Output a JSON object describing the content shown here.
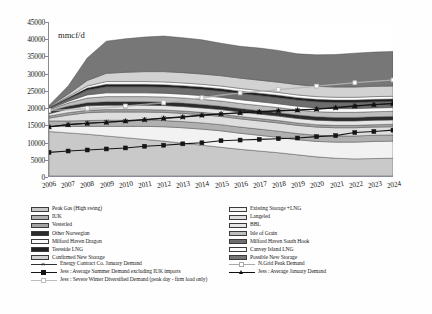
{
  "chart_data": {
    "type": "area",
    "title": "",
    "xlabel": "",
    "ylabel": "mmcf/d",
    "unit_label": "mmcf/d",
    "ylim": [
      0,
      45000
    ],
    "ytick_step": 5000,
    "yticks": [
      "45000",
      "40000",
      "35000",
      "30000",
      "25000",
      "20000",
      "15000",
      "10000",
      "5000",
      "0"
    ],
    "categories": [
      "2006",
      "2007",
      "2008",
      "2009",
      "2010",
      "2011",
      "2012",
      "2013",
      "2014",
      "2015",
      "2016",
      "2017",
      "2018",
      "2019",
      "2020",
      "2021",
      "2022",
      "2023",
      "2024"
    ],
    "grid": false,
    "legend_position": "bottom",
    "stacked_series": [
      {
        "name": "UKCS (Peak Gas High swing base)",
        "legend": "Peak Gas (High swing)",
        "fill": "#c9c9c9",
        "values": [
          13000,
          12600,
          12200,
          11700,
          11200,
          10700,
          10200,
          9600,
          9000,
          8400,
          7800,
          7300,
          6800,
          6200,
          5600,
          5200,
          5000,
          5100,
          5200
        ]
      },
      {
        "name": "Existing Storage + LNG",
        "legend": "Existing Storage +LNG",
        "fill": "#f2f2f2",
        "values": [
          1600,
          1900,
          2300,
          2800,
          3300,
          3800,
          4200,
          4500,
          4700,
          4800,
          4700,
          4600,
          4500,
          4400,
          4500,
          4700,
          4900,
          5000,
          5000
        ]
      },
      {
        "name": "IUK",
        "legend": "IUK",
        "fill": "#b0b0b0",
        "values": [
          1500,
          1600,
          1700,
          1800,
          1800,
          1800,
          1800,
          1800,
          1800,
          1800,
          1800,
          1800,
          1800,
          1800,
          1800,
          1800,
          1800,
          1800,
          1800
        ]
      },
      {
        "name": "Langeled",
        "legend": "Langeled",
        "fill": "#dedede",
        "values": [
          800,
          1700,
          2300,
          2400,
          2400,
          2400,
          2400,
          2400,
          2400,
          2400,
          2400,
          2400,
          2400,
          2400,
          2400,
          2400,
          2400,
          2400,
          2400
        ]
      },
      {
        "name": "Vesterled",
        "legend": "Vesterled",
        "fill": "#a2a2a2",
        "values": [
          600,
          700,
          700,
          700,
          700,
          700,
          700,
          700,
          700,
          700,
          700,
          700,
          700,
          700,
          700,
          700,
          700,
          700,
          700
        ]
      },
      {
        "name": "BBL",
        "legend": "BBL",
        "fill": "#e6e6e6",
        "values": [
          700,
          1100,
          1300,
          1300,
          1300,
          1300,
          1300,
          1300,
          1300,
          1300,
          1300,
          1300,
          1300,
          1300,
          1300,
          1300,
          1300,
          1300,
          1300
        ]
      },
      {
        "name": "Other Norwegian",
        "legend": "Other Norwegian",
        "fill": "#2b2b2b",
        "values": [
          700,
          800,
          900,
          1000,
          1000,
          1000,
          1000,
          1000,
          1000,
          1000,
          1000,
          1000,
          1000,
          1000,
          1000,
          1000,
          1000,
          1000,
          1000
        ]
      },
      {
        "name": "Isle of Grain",
        "legend": "Isle of Grain",
        "fill": "#bdbdbd",
        "values": [
          500,
          900,
          1400,
          1500,
          1500,
          1500,
          1500,
          1500,
          1500,
          1500,
          1500,
          1500,
          1500,
          1500,
          1500,
          1500,
          1500,
          1500,
          1500
        ]
      },
      {
        "name": "Milford Haven Dragon",
        "legend": "Milford Haven Dragon",
        "fill": "#fbfbfb",
        "values": [
          200,
          500,
          900,
          1100,
          1100,
          1100,
          1100,
          1100,
          1100,
          1100,
          1100,
          1100,
          1100,
          1100,
          1100,
          1100,
          1100,
          1100,
          1100
        ]
      },
      {
        "name": "Milford Haven South Hook",
        "legend": "Milford Haven South Hook",
        "fill": "#6e6e6e",
        "values": [
          200,
          700,
          1400,
          1800,
          1800,
          1800,
          1800,
          1800,
          1800,
          1800,
          1800,
          1800,
          1800,
          1800,
          1800,
          1800,
          1800,
          1800,
          1800
        ]
      },
      {
        "name": "Teesside LNG",
        "legend": "Teesside LNG",
        "fill": "#1f1f1f",
        "values": [
          200,
          400,
          600,
          700,
          700,
          700,
          700,
          700,
          700,
          700,
          700,
          700,
          700,
          700,
          700,
          700,
          700,
          700,
          700
        ]
      },
      {
        "name": "Canvey Island LNG",
        "legend": "Canvey Island LNG",
        "fill": "#fdfdfd",
        "values": [
          100,
          300,
          600,
          800,
          800,
          800,
          800,
          800,
          800,
          800,
          800,
          800,
          800,
          800,
          800,
          800,
          800,
          800,
          800
        ]
      },
      {
        "name": "Confirmed New Storage",
        "legend": "Confirmed New Storage",
        "fill": "#d2d2d2",
        "values": [
          200,
          700,
          1600,
          2400,
          2700,
          2900,
          3000,
          3000,
          3000,
          3000,
          3000,
          3000,
          3000,
          3000,
          3000,
          3000,
          3000,
          3000,
          3000
        ]
      },
      {
        "name": "Possible New Storage",
        "legend": "Possible New Storage",
        "fill": "#777777",
        "values": [
          300,
          2400,
          6600,
          9400,
          9800,
          10100,
          10400,
          10200,
          10000,
          9500,
          9300,
          9400,
          9300,
          9000,
          9200,
          9500,
          9900,
          10000,
          10100
        ]
      }
    ],
    "line_series": [
      {
        "name": "Energy Contract Co. January Demand",
        "legend": "Energy Contract Co. January Demand",
        "color": "#303030",
        "marker": "x",
        "values": [
          14300,
          15000,
          15400,
          15700,
          16000,
          16400,
          16800,
          17200,
          17700,
          18100,
          18400,
          18700,
          19000,
          19200,
          19500,
          19900,
          20400,
          20800,
          21100
        ]
      },
      {
        "name": "N.Grid Peak Demand",
        "legend": "N.Grid Peak Demand",
        "color": "#a9a9a9",
        "marker": "square-open",
        "values": [
          19000,
          19300,
          19600,
          19900,
          20300,
          20800,
          21300,
          22000,
          22700,
          23500,
          24200,
          24700,
          25200,
          25700,
          26200,
          26700,
          27200,
          27600,
          28000
        ]
      },
      {
        "name": "Jess : Average Summer Demand excluding IUK imports",
        "legend": "Jess : Average Summer Demand excluding IUK imports",
        "color": "#151515",
        "marker": "square-filled",
        "values": [
          6900,
          7300,
          7600,
          7900,
          8200,
          8700,
          9000,
          9400,
          9700,
          10300,
          10500,
          10700,
          10900,
          11100,
          11500,
          11800,
          12700,
          13000,
          13400
        ]
      },
      {
        "name": "Jess : Average January Demand",
        "legend": "Jess : Average January Demand",
        "color": "#111111",
        "marker": "triangle",
        "values": [
          14400,
          15000,
          15400,
          15700,
          16100,
          16500,
          16900,
          17300,
          17800,
          18200,
          18500,
          18800,
          19100,
          19300,
          19600,
          20000,
          20500,
          20900,
          21200
        ]
      },
      {
        "name": "Jess : Severe Winter Diversified Demand (peak day - firm load only)",
        "legend": "Jess : Severe Winter Diversified Demand (peak day - firm load only)",
        "color": "#bbbbbb",
        "marker": "square-open",
        "values": [
          19200,
          19500,
          19800,
          20100,
          20500,
          21000,
          21500,
          22200,
          22900,
          23700,
          24300,
          24800,
          25300,
          25800,
          26300,
          26800,
          27300,
          27700,
          28100
        ]
      }
    ]
  },
  "legend": {
    "left_column": [
      {
        "label": "Peak Gas (High swing)",
        "swatch": "#c9c9c9",
        "kind": "area"
      },
      {
        "label": "IUK",
        "swatch": "#b0b0b0",
        "kind": "area"
      },
      {
        "label": "Vesterled",
        "swatch": "#a2a2a2",
        "kind": "area"
      },
      {
        "label": "Other Norwegian",
        "swatch": "#2b2b2b",
        "kind": "area"
      },
      {
        "label": "Milford Haven Dragon",
        "swatch": "#fbfbfb",
        "kind": "area"
      },
      {
        "label": "Teesside LNG",
        "swatch": "#1f1f1f",
        "kind": "area"
      },
      {
        "label": "Confirmed New Storage",
        "swatch": "#d2d2d2",
        "kind": "area"
      }
    ],
    "right_column": [
      {
        "label": "Existing Storage +LNG",
        "swatch": "#f2f2f2",
        "kind": "area"
      },
      {
        "label": "Langeled",
        "swatch": "#dedede",
        "kind": "area"
      },
      {
        "label": "BBL",
        "swatch": "#e6e6e6",
        "kind": "area"
      },
      {
        "label": "Isle of Grain",
        "swatch": "#bdbdbd",
        "kind": "area"
      },
      {
        "label": "Milford Haven South Hook",
        "swatch": "#6e6e6e",
        "kind": "area"
      },
      {
        "label": "Canvey Island LNG",
        "swatch": "#fdfdfd",
        "kind": "area"
      },
      {
        "label": "Possible New Storage",
        "swatch": "#777777",
        "kind": "area"
      }
    ],
    "line_entries_left": [
      {
        "label": "Energy Contract Co. January Demand",
        "color": "#303030",
        "marker": "x"
      },
      {
        "label": "Jess : Average Summer Demand excluding IUK imports",
        "color": "#151515",
        "marker": "square-filled"
      },
      {
        "label": "Jess : Severe Winter Diversified Demand (peak day - firm load only)",
        "color": "#bbbbbb",
        "marker": "square-open"
      }
    ],
    "line_entries_right": [
      {
        "label": "N.Grid Peak Demand",
        "color": "#a9a9a9",
        "marker": "square-open"
      },
      {
        "label": "Jess : Average January Demand",
        "color": "#111111",
        "marker": "triangle"
      }
    ]
  }
}
